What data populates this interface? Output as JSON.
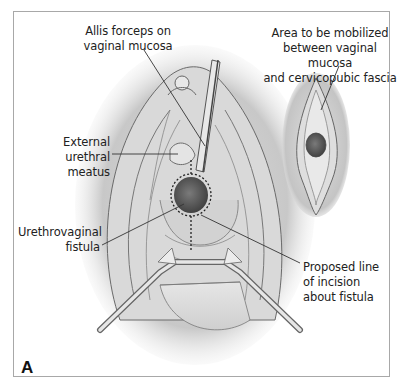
{
  "figure": {
    "panel_letter": "A",
    "labels": {
      "allis_forceps": [
        "Allis forceps on",
        "vaginal mucosa"
      ],
      "area_mobilized": [
        "Area to be mobilized",
        "between vaginal mucosa",
        "and cervicopubic fascia"
      ],
      "urethral_meatus": [
        "External urethral",
        "meatus"
      ],
      "fistula": [
        "Urethrovaginal",
        "fistula"
      ],
      "incision": [
        "Proposed line",
        "of incision",
        "about fistula"
      ]
    },
    "colors": {
      "border": "#a8a8a8",
      "tissue_light": "#e6e6e6",
      "tissue_shadow": "#9a9a9a",
      "fistula": "#5a5a5a",
      "text": "#222222"
    }
  }
}
